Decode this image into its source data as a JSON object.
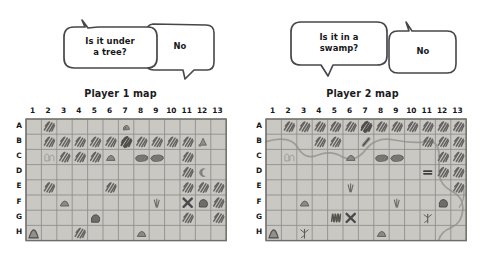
{
  "figure": {
    "kind": "hand-drawn-illustration",
    "background_color": "#ffffff",
    "ink_color": "#3b3b40",
    "map_paper_color": "#c9c8c3",
    "map_grid_line_color": "#8e8d88",
    "map_border_color": "#6f6e6a",
    "terrain_ink_color": "#63625f",
    "water_color": "#9d9c97",
    "x_mark_color": "#4a4a4d"
  },
  "panels": [
    {
      "id": "player1",
      "map_title": "Player 1 map",
      "dialogue": {
        "question": "Is it under\na tree?",
        "answer": "No"
      },
      "grid": {
        "columns": [
          "1",
          "2",
          "3",
          "4",
          "5",
          "6",
          "7",
          "8",
          "9",
          "10",
          "11",
          "12",
          "13"
        ],
        "rows": [
          "A",
          "B",
          "C",
          "D",
          "E",
          "F",
          "G",
          "H"
        ],
        "cells": [
          {
            "row": "A",
            "col": "2",
            "symbol": "trees"
          },
          {
            "row": "A",
            "col": "7",
            "symbol": "rock"
          },
          {
            "row": "B",
            "col": "2",
            "symbol": "trees"
          },
          {
            "row": "B",
            "col": "3",
            "symbol": "trees"
          },
          {
            "row": "B",
            "col": "4",
            "symbol": "trees"
          },
          {
            "row": "B",
            "col": "5",
            "symbol": "trees"
          },
          {
            "row": "B",
            "col": "6",
            "symbol": "trees"
          },
          {
            "row": "B",
            "col": "7",
            "symbol": "trees-dense"
          },
          {
            "row": "B",
            "col": "8",
            "symbol": "trees"
          },
          {
            "row": "B",
            "col": "9",
            "symbol": "trees"
          },
          {
            "row": "B",
            "col": "10",
            "symbol": "trees"
          },
          {
            "row": "B",
            "col": "11",
            "symbol": "trees"
          },
          {
            "row": "B",
            "col": "12",
            "symbol": "camp"
          },
          {
            "row": "C",
            "col": "2",
            "symbol": "ruins"
          },
          {
            "row": "C",
            "col": "3",
            "symbol": "trees"
          },
          {
            "row": "C",
            "col": "4",
            "symbol": "trees"
          },
          {
            "row": "C",
            "col": "5",
            "symbol": "trees"
          },
          {
            "row": "C",
            "col": "6",
            "symbol": "hill"
          },
          {
            "row": "C",
            "col": "8",
            "symbol": "swamp"
          },
          {
            "row": "C",
            "col": "9",
            "symbol": "swamp"
          },
          {
            "row": "C",
            "col": "11",
            "symbol": "trees"
          },
          {
            "row": "D",
            "col": "11",
            "symbol": "trees"
          },
          {
            "row": "D",
            "col": "12",
            "symbol": "cave"
          },
          {
            "row": "E",
            "col": "2",
            "symbol": "trees"
          },
          {
            "row": "E",
            "col": "6",
            "symbol": "trees"
          },
          {
            "row": "E",
            "col": "11",
            "symbol": "trees"
          },
          {
            "row": "E",
            "col": "12",
            "symbol": "trees"
          },
          {
            "row": "E",
            "col": "13",
            "symbol": "trees"
          },
          {
            "row": "F",
            "col": "3",
            "symbol": "hill"
          },
          {
            "row": "F",
            "col": "9",
            "symbol": "grass"
          },
          {
            "row": "F",
            "col": "11",
            "symbol": "x-mark"
          },
          {
            "row": "F",
            "col": "12",
            "symbol": "boulder"
          },
          {
            "row": "F",
            "col": "13",
            "symbol": "trees"
          },
          {
            "row": "G",
            "col": "5",
            "symbol": "boulder"
          },
          {
            "row": "G",
            "col": "11",
            "symbol": "trees"
          },
          {
            "row": "G",
            "col": "13",
            "symbol": "trees"
          },
          {
            "row": "H",
            "col": "1",
            "symbol": "hill-dark"
          },
          {
            "row": "H",
            "col": "4",
            "symbol": "trees"
          },
          {
            "row": "H",
            "col": "8",
            "symbol": "hill"
          }
        ],
        "rivers": []
      }
    },
    {
      "id": "player2",
      "map_title": "Player 2 map",
      "dialogue": {
        "question": "Is it in a\nswamp?",
        "answer": "No"
      },
      "grid": {
        "columns": [
          "1",
          "2",
          "3",
          "4",
          "5",
          "6",
          "7",
          "8",
          "9",
          "10",
          "11",
          "12",
          "13"
        ],
        "rows": [
          "A",
          "B",
          "C",
          "D",
          "E",
          "F",
          "G",
          "H"
        ],
        "cells": [
          {
            "row": "A",
            "col": "2",
            "symbol": "trees"
          },
          {
            "row": "A",
            "col": "3",
            "symbol": "trees"
          },
          {
            "row": "A",
            "col": "4",
            "symbol": "trees"
          },
          {
            "row": "A",
            "col": "5",
            "symbol": "trees"
          },
          {
            "row": "A",
            "col": "6",
            "symbol": "trees"
          },
          {
            "row": "A",
            "col": "7",
            "symbol": "trees-dense"
          },
          {
            "row": "A",
            "col": "8",
            "symbol": "trees"
          },
          {
            "row": "A",
            "col": "9",
            "symbol": "trees"
          },
          {
            "row": "A",
            "col": "10",
            "symbol": "trees"
          },
          {
            "row": "A",
            "col": "11",
            "symbol": "trees"
          },
          {
            "row": "A",
            "col": "12",
            "symbol": "trees"
          },
          {
            "row": "A",
            "col": "13",
            "symbol": "trees"
          },
          {
            "row": "B",
            "col": "4",
            "symbol": "trees"
          },
          {
            "row": "B",
            "col": "5",
            "symbol": "trees"
          },
          {
            "row": "B",
            "col": "7",
            "symbol": "log"
          },
          {
            "row": "B",
            "col": "11",
            "symbol": "trees"
          },
          {
            "row": "B",
            "col": "12",
            "symbol": "trees"
          },
          {
            "row": "B",
            "col": "13",
            "symbol": "trees"
          },
          {
            "row": "C",
            "col": "2",
            "symbol": "ruins"
          },
          {
            "row": "C",
            "col": "6",
            "symbol": "hill"
          },
          {
            "row": "C",
            "col": "8",
            "symbol": "swamp"
          },
          {
            "row": "C",
            "col": "9",
            "symbol": "swamp"
          },
          {
            "row": "C",
            "col": "12",
            "symbol": "trees"
          },
          {
            "row": "C",
            "col": "13",
            "symbol": "trees"
          },
          {
            "row": "D",
            "col": "11",
            "symbol": "bridge"
          },
          {
            "row": "D",
            "col": "12",
            "symbol": "trees"
          },
          {
            "row": "D",
            "col": "13",
            "symbol": "trees"
          },
          {
            "row": "E",
            "col": "6",
            "symbol": "grass"
          },
          {
            "row": "E",
            "col": "13",
            "symbol": "trees"
          },
          {
            "row": "F",
            "col": "3",
            "symbol": "hill"
          },
          {
            "row": "F",
            "col": "9",
            "symbol": "grass"
          },
          {
            "row": "F",
            "col": "12",
            "symbol": "boulder"
          },
          {
            "row": "G",
            "col": "5",
            "symbol": "scribble"
          },
          {
            "row": "G",
            "col": "6",
            "symbol": "x-mark"
          },
          {
            "row": "G",
            "col": "11",
            "symbol": "dead-tree"
          },
          {
            "row": "H",
            "col": "1",
            "symbol": "hill-dark"
          },
          {
            "row": "H",
            "col": "3",
            "symbol": "dead-tree"
          },
          {
            "row": "H",
            "col": "8",
            "symbol": "hill"
          }
        ],
        "rivers": [
          {
            "name": "main-river",
            "description": "winding river entering at B2, meandering east through C4-C5, B7, B9-B10, turning south at D11 under the bridge, then south-east past F13 and down to H11"
          }
        ]
      }
    }
  ]
}
